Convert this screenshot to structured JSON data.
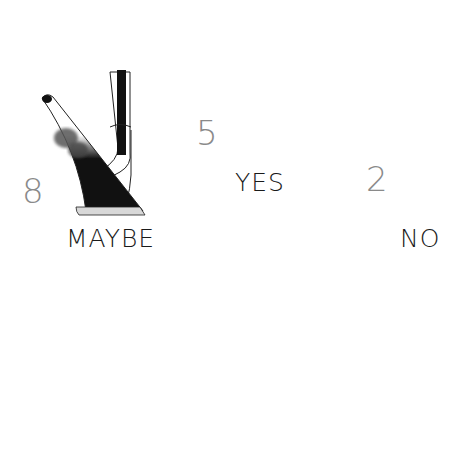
{
  "illustration": {
    "title": "Golf club selection from rough",
    "clubs": [
      {
        "name": "8-iron",
        "number": "8",
        "label": "MAYBE"
      },
      {
        "name": "5-iron",
        "number": "5",
        "label": "YES"
      },
      {
        "name": "2-iron",
        "number": "2",
        "label": "NO"
      }
    ],
    "ball": "golf-ball-in-grass",
    "colors": {
      "ink": "#111111",
      "grass": "#8c8c8c",
      "number": "#8a8a8a",
      "sole": "#d8d8d8"
    }
  }
}
